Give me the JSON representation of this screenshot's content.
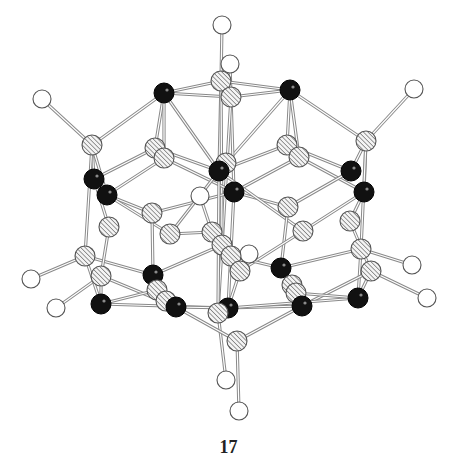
{
  "figure": {
    "compound_label": "17",
    "legend": {
      "hydrogen": "open circle",
      "metal": "filled black circle",
      "framework": "hatched circle"
    },
    "colors": {
      "bond": "#8a8a8a",
      "metal_fill": "#111111",
      "hydrogen_fill": "#ffffff",
      "hatch_line": "#666666"
    },
    "atoms": [
      {
        "id": "H1",
        "type": "H",
        "x": 222,
        "y": 25,
        "r": 9
      },
      {
        "id": "H2",
        "type": "H",
        "x": 230,
        "y": 64,
        "r": 9
      },
      {
        "id": "H3",
        "type": "H",
        "x": 42,
        "y": 99,
        "r": 9
      },
      {
        "id": "H4",
        "type": "H",
        "x": 414,
        "y": 89,
        "r": 9
      },
      {
        "id": "H5",
        "type": "H",
        "x": 200,
        "y": 196,
        "r": 9
      },
      {
        "id": "H6",
        "type": "H",
        "x": 249,
        "y": 254,
        "r": 9
      },
      {
        "id": "H7",
        "type": "H",
        "x": 31,
        "y": 279,
        "r": 9
      },
      {
        "id": "H8",
        "type": "H",
        "x": 56,
        "y": 308,
        "r": 9
      },
      {
        "id": "H9",
        "type": "H",
        "x": 412,
        "y": 265,
        "r": 9
      },
      {
        "id": "H10",
        "type": "H",
        "x": 427,
        "y": 298,
        "r": 9
      },
      {
        "id": "H11",
        "type": "H",
        "x": 226,
        "y": 380,
        "r": 9
      },
      {
        "id": "H12",
        "type": "H",
        "x": 239,
        "y": 411,
        "r": 9
      },
      {
        "id": "X1",
        "type": "X",
        "x": 221,
        "y": 81,
        "r": 10
      },
      {
        "id": "X2",
        "type": "X",
        "x": 231,
        "y": 97,
        "r": 10
      },
      {
        "id": "X3",
        "type": "X",
        "x": 92,
        "y": 145,
        "r": 10
      },
      {
        "id": "X4",
        "type": "X",
        "x": 155,
        "y": 148,
        "r": 10
      },
      {
        "id": "X5",
        "type": "X",
        "x": 164,
        "y": 158,
        "r": 10
      },
      {
        "id": "X6",
        "type": "X",
        "x": 226,
        "y": 163,
        "r": 10
      },
      {
        "id": "X7",
        "type": "X",
        "x": 287,
        "y": 145,
        "r": 10
      },
      {
        "id": "X8",
        "type": "X",
        "x": 299,
        "y": 157,
        "r": 10
      },
      {
        "id": "X9",
        "type": "X",
        "x": 366,
        "y": 141,
        "r": 10
      },
      {
        "id": "X10",
        "type": "X",
        "x": 152,
        "y": 213,
        "r": 10
      },
      {
        "id": "X11",
        "type": "X",
        "x": 170,
        "y": 234,
        "r": 10
      },
      {
        "id": "X12",
        "type": "X",
        "x": 288,
        "y": 207,
        "r": 10
      },
      {
        "id": "X13",
        "type": "X",
        "x": 303,
        "y": 231,
        "r": 10
      },
      {
        "id": "X14",
        "type": "X",
        "x": 350,
        "y": 221,
        "r": 10
      },
      {
        "id": "X15",
        "type": "X",
        "x": 109,
        "y": 227,
        "r": 10
      },
      {
        "id": "X16",
        "type": "X",
        "x": 212,
        "y": 232,
        "r": 10
      },
      {
        "id": "X17",
        "type": "X",
        "x": 222,
        "y": 245,
        "r": 10
      },
      {
        "id": "X18",
        "type": "X",
        "x": 231,
        "y": 256,
        "r": 10
      },
      {
        "id": "X19",
        "type": "X",
        "x": 240,
        "y": 271,
        "r": 10
      },
      {
        "id": "X20",
        "type": "X",
        "x": 85,
        "y": 256,
        "r": 10
      },
      {
        "id": "X21",
        "type": "X",
        "x": 101,
        "y": 276,
        "r": 10
      },
      {
        "id": "X22",
        "type": "X",
        "x": 361,
        "y": 249,
        "r": 10
      },
      {
        "id": "X23",
        "type": "X",
        "x": 371,
        "y": 271,
        "r": 10
      },
      {
        "id": "X24",
        "type": "X",
        "x": 157,
        "y": 290,
        "r": 10
      },
      {
        "id": "X25",
        "type": "X",
        "x": 166,
        "y": 301,
        "r": 10
      },
      {
        "id": "X26",
        "type": "X",
        "x": 292,
        "y": 285,
        "r": 10
      },
      {
        "id": "X27",
        "type": "X",
        "x": 296,
        "y": 293,
        "r": 10
      },
      {
        "id": "X28",
        "type": "X",
        "x": 218,
        "y": 313,
        "r": 10
      },
      {
        "id": "X29",
        "type": "X",
        "x": 237,
        "y": 341,
        "r": 10
      },
      {
        "id": "M1",
        "type": "M",
        "x": 164,
        "y": 93,
        "r": 10
      },
      {
        "id": "M2",
        "type": "M",
        "x": 290,
        "y": 90,
        "r": 10
      },
      {
        "id": "M3",
        "type": "M",
        "x": 94,
        "y": 179,
        "r": 10
      },
      {
        "id": "M4",
        "type": "M",
        "x": 107,
        "y": 195,
        "r": 10
      },
      {
        "id": "M5",
        "type": "M",
        "x": 219,
        "y": 171,
        "r": 10
      },
      {
        "id": "M6",
        "type": "M",
        "x": 234,
        "y": 192,
        "r": 10
      },
      {
        "id": "M7",
        "type": "M",
        "x": 351,
        "y": 171,
        "r": 10
      },
      {
        "id": "M8",
        "type": "M",
        "x": 364,
        "y": 192,
        "r": 10
      },
      {
        "id": "M9",
        "type": "M",
        "x": 153,
        "y": 275,
        "r": 10
      },
      {
        "id": "M10",
        "type": "M",
        "x": 281,
        "y": 268,
        "r": 10
      },
      {
        "id": "M11",
        "type": "M",
        "x": 101,
        "y": 304,
        "r": 10
      },
      {
        "id": "M12",
        "type": "M",
        "x": 176,
        "y": 307,
        "r": 10
      },
      {
        "id": "M13",
        "type": "M",
        "x": 228,
        "y": 308,
        "r": 10
      },
      {
        "id": "M14",
        "type": "M",
        "x": 302,
        "y": 306,
        "r": 10
      },
      {
        "id": "M15",
        "type": "M",
        "x": 358,
        "y": 298,
        "r": 10
      }
    ],
    "bonds": [
      [
        "H1",
        "X1"
      ],
      [
        "H2",
        "X2"
      ],
      [
        "H3",
        "X3"
      ],
      [
        "H4",
        "X9"
      ],
      [
        "H5",
        "X16"
      ],
      [
        "H6",
        "X18"
      ],
      [
        "H7",
        "X20"
      ],
      [
        "H8",
        "X21"
      ],
      [
        "H9",
        "X22"
      ],
      [
        "H10",
        "X23"
      ],
      [
        "H11",
        "X28"
      ],
      [
        "H12",
        "X29"
      ],
      [
        "M1",
        "X1"
      ],
      [
        "M1",
        "X2"
      ],
      [
        "M2",
        "X1"
      ],
      [
        "M2",
        "X2"
      ],
      [
        "M1",
        "X3"
      ],
      [
        "M2",
        "X9"
      ],
      [
        "M1",
        "X4"
      ],
      [
        "M1",
        "X5"
      ],
      [
        "M1",
        "M5"
      ],
      [
        "M2",
        "X7"
      ],
      [
        "M2",
        "X8"
      ],
      [
        "M2",
        "M5"
      ],
      [
        "X1",
        "M5"
      ],
      [
        "X2",
        "M6"
      ],
      [
        "X2",
        "X28"
      ],
      [
        "X1",
        "X17"
      ],
      [
        "X3",
        "M3"
      ],
      [
        "X3",
        "M4"
      ],
      [
        "X3",
        "X20"
      ],
      [
        "X9",
        "M7"
      ],
      [
        "X9",
        "M8"
      ],
      [
        "X9",
        "X22"
      ],
      [
        "M3",
        "X4"
      ],
      [
        "M4",
        "X5"
      ],
      [
        "M3",
        "X15"
      ],
      [
        "M4",
        "X10"
      ],
      [
        "M4",
        "X11"
      ],
      [
        "M7",
        "X7"
      ],
      [
        "M8",
        "X8"
      ],
      [
        "M7",
        "X12"
      ],
      [
        "M8",
        "X14"
      ],
      [
        "M8",
        "X13"
      ],
      [
        "X5",
        "M6"
      ],
      [
        "X4",
        "M5"
      ],
      [
        "X7",
        "M5"
      ],
      [
        "X8",
        "M6"
      ],
      [
        "M6",
        "X10"
      ],
      [
        "M6",
        "X12"
      ],
      [
        "M5",
        "X11"
      ],
      [
        "M5",
        "X13"
      ],
      [
        "X10",
        "M9"
      ],
      [
        "X11",
        "X16"
      ],
      [
        "X12",
        "M10"
      ],
      [
        "X13",
        "X19"
      ],
      [
        "X20",
        "M11"
      ],
      [
        "X21",
        "M11"
      ],
      [
        "X20",
        "M9"
      ],
      [
        "X21",
        "M12"
      ],
      [
        "X22",
        "M15"
      ],
      [
        "X23",
        "M15"
      ],
      [
        "X22",
        "M10"
      ],
      [
        "X23",
        "M14"
      ],
      [
        "M9",
        "X24"
      ],
      [
        "M9",
        "X17"
      ],
      [
        "M10",
        "X26"
      ],
      [
        "M10",
        "X18"
      ],
      [
        "M11",
        "X24"
      ],
      [
        "M11",
        "M13"
      ],
      [
        "M12",
        "X29"
      ],
      [
        "M12",
        "M13"
      ],
      [
        "M13",
        "X19"
      ],
      [
        "M13",
        "M14"
      ],
      [
        "M13",
        "X28"
      ],
      [
        "M13",
        "M15"
      ],
      [
        "M14",
        "X29"
      ],
      [
        "M14",
        "X26"
      ],
      [
        "M15",
        "X27"
      ],
      [
        "X24",
        "X25"
      ],
      [
        "X26",
        "X27"
      ],
      [
        "X15",
        "X21"
      ],
      [
        "X14",
        "X23"
      ],
      [
        "X16",
        "X17"
      ],
      [
        "X17",
        "X18"
      ],
      [
        "X18",
        "X19"
      ],
      [
        "M6",
        "M13"
      ],
      [
        "M5",
        "X28"
      ]
    ]
  }
}
